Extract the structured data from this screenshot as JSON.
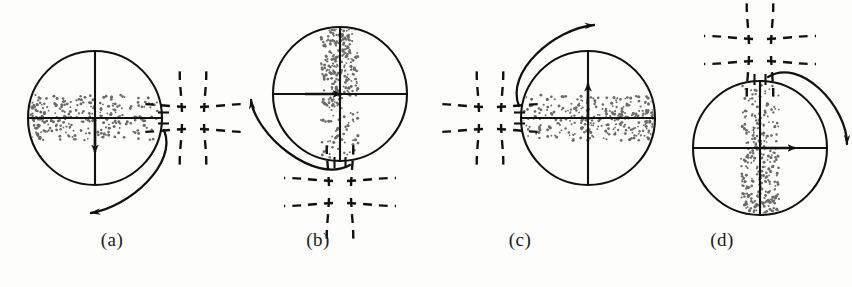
{
  "figure": {
    "kind": "scientific-diagram",
    "background_color": "#fdfdfb",
    "stroke_color": "#111111",
    "dot_color": "#6a6a6a"
  },
  "panels": [
    {
      "id": "a",
      "label": "(a)",
      "label_x": 112,
      "label_y": 243,
      "circle": {
        "cx": 95,
        "cy": 118,
        "r": 67
      },
      "band": {
        "orientation": "horizontal",
        "dense_side": "left"
      },
      "flow_arrow": {
        "direction": "down",
        "x": 95,
        "y_start": 118,
        "y_end": 152
      },
      "xpoint": {
        "cx": 193,
        "cy": 118,
        "orientation": "vertical-pair"
      },
      "rotation": {
        "sense": "counterclockwise",
        "position": "bottom-right"
      },
      "slot": {
        "side": "right",
        "cx": 162,
        "cy": 118
      }
    },
    {
      "id": "b",
      "label": "(b)",
      "label_x": 318,
      "label_y": 243,
      "circle": {
        "cx": 340,
        "cy": 94,
        "r": 67
      },
      "band": {
        "orientation": "vertical",
        "dense_side": "top"
      },
      "flow_arrow": {
        "direction": "right",
        "y": 94,
        "x_start": 305,
        "x_end": 340
      },
      "xpoint": {
        "cx": 340,
        "cy": 192,
        "orientation": "horizontal-pair"
      },
      "rotation": {
        "sense": "counterclockwise",
        "position": "left-bottom"
      },
      "slot": {
        "side": "bottom",
        "cx": 340,
        "cy": 161
      }
    },
    {
      "id": "c",
      "label": "(c)",
      "label_x": 520,
      "label_y": 243,
      "circle": {
        "cx": 588,
        "cy": 118,
        "r": 67
      },
      "band": {
        "orientation": "horizontal",
        "dense_side": "right"
      },
      "flow_arrow": {
        "direction": "up",
        "x": 588,
        "y_start": 118,
        "y_end": 84
      },
      "xpoint": {
        "cx": 490,
        "cy": 118,
        "orientation": "vertical-pair"
      },
      "rotation": {
        "sense": "clockwise",
        "position": "top-left"
      },
      "slot": {
        "side": "left",
        "cx": 521,
        "cy": 118
      }
    },
    {
      "id": "d",
      "label": "(d)",
      "label_x": 722,
      "label_y": 243,
      "circle": {
        "cx": 760,
        "cy": 148,
        "r": 67
      },
      "band": {
        "orientation": "vertical",
        "dense_side": "bottom"
      },
      "flow_arrow": {
        "direction": "right",
        "y": 148,
        "x_start": 760,
        "x_end": 795
      },
      "xpoint": {
        "cx": 760,
        "cy": 50,
        "orientation": "horizontal-pair"
      },
      "rotation": {
        "sense": "clockwise",
        "position": "right-top"
      },
      "slot": {
        "side": "top",
        "cx": 760,
        "cy": 81
      }
    }
  ]
}
